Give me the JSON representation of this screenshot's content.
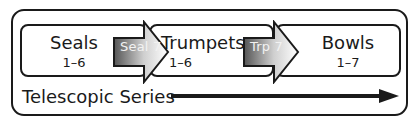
{
  "diagram": {
    "stages": [
      {
        "title": "Seals",
        "range": "1–6"
      },
      {
        "title": "Trumpets",
        "range": "1–6"
      },
      {
        "title": "Bowls",
        "range": "1–7"
      }
    ],
    "transitions": [
      {
        "label": "Seal 7"
      },
      {
        "label": "Trp 7"
      }
    ],
    "series_label": "Telescopic Series",
    "colors": {
      "stroke": "#1a1a1a",
      "arrow_gradient_dark": "#555555",
      "arrow_gradient_light": "#ffffff"
    }
  }
}
